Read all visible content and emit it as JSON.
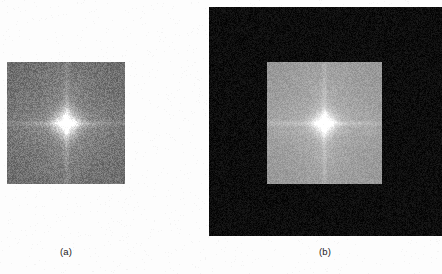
{
  "figure": {
    "type": "image-pair",
    "background_color": "#fdfdfd",
    "width": 442,
    "height": 274,
    "panels": [
      {
        "id": "a",
        "caption": "(a)",
        "caption_x": 66,
        "caption_y": 246,
        "description": "Fourier magnitude spectrum of an image, displayed without zero padding",
        "outer": {
          "x": 7,
          "y": 62,
          "w": 118,
          "h": 122,
          "mean_color": "#6d6d6d",
          "noise_amplitude": 22
        },
        "inner": null,
        "center_glow": {
          "cx": 66,
          "cy": 123,
          "radius": 26,
          "peak_color": "#f2f2f2"
        },
        "streaks": {
          "vertical": true,
          "horizontal": true,
          "color": "#9a9a9a"
        }
      },
      {
        "id": "b",
        "caption": "(b)",
        "caption_x": 325,
        "caption_y": 246,
        "description": "Fourier magnitude spectrum of the same image after zero padding; spectrum occupies the central region of a larger dark field",
        "outer": {
          "x": 209,
          "y": 7,
          "w": 233,
          "h": 229,
          "mean_color": "#0d0d0d",
          "noise_amplitude": 12
        },
        "inner": {
          "x": 267,
          "y": 62,
          "w": 115,
          "h": 122,
          "mean_color": "#989898",
          "noise_amplitude": 14
        },
        "center_glow": {
          "cx": 324,
          "cy": 123,
          "radius": 24,
          "peak_color": "#ffffff"
        },
        "streaks": {
          "vertical": true,
          "horizontal": true,
          "color": "#b4b4b4"
        }
      }
    ]
  },
  "chart_data": {
    "type": "heatmap",
    "title": "",
    "xlabel": "",
    "ylabel": "",
    "panel_labels": [
      "(a)",
      "(b)"
    ],
    "series": [
      {
        "name": "(a) spectrum without padding",
        "field_mean_gray": 109,
        "field_gray_range": [
          70,
          150
        ],
        "center_peak_gray": 242,
        "extent_px": [
          118,
          122
        ]
      },
      {
        "name": "(b) spectrum with zero padding",
        "background_mean_gray": 13,
        "background_gray_range": [
          0,
          30
        ],
        "field_mean_gray": 152,
        "field_gray_range": [
          128,
          182
        ],
        "center_peak_gray": 255,
        "field_extent_px": [
          115,
          122
        ],
        "extent_px": [
          233,
          229
        ]
      }
    ],
    "colormap": "grayscale",
    "grid": false,
    "legend": null
  }
}
